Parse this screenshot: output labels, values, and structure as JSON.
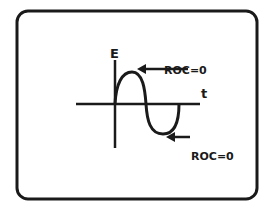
{
  "diagram": {
    "axis_labels": {
      "y": "E",
      "x": "t"
    },
    "annotations": [
      {
        "text": "ROC=0",
        "position": "peak"
      },
      {
        "text": "ROC=0",
        "position": "trough"
      }
    ],
    "colors": {
      "ink": "#1a1a1a",
      "background": "#ffffff"
    }
  }
}
